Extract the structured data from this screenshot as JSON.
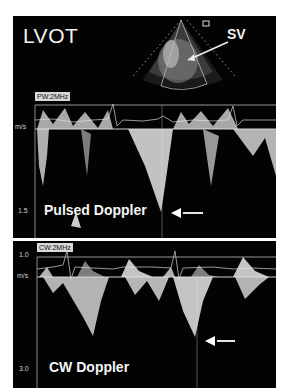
{
  "top_panel": {
    "view_label": "LVOT",
    "sample_volume_label": "SV",
    "mode_label": "PW:2MHz",
    "unit_label": "m/s",
    "scale_label": "1.5",
    "caption": "Pulsed Doppler"
  },
  "bottom_panel": {
    "mode_label": "CW:2MHz",
    "scale_top_label": "1.0",
    "unit_label": "m/s",
    "scale_label": "3.0",
    "caption": "CW Doppler"
  },
  "colors": {
    "background": "#030303",
    "signal": "#e8e8e8",
    "trace_line": "#bdbdbd"
  }
}
